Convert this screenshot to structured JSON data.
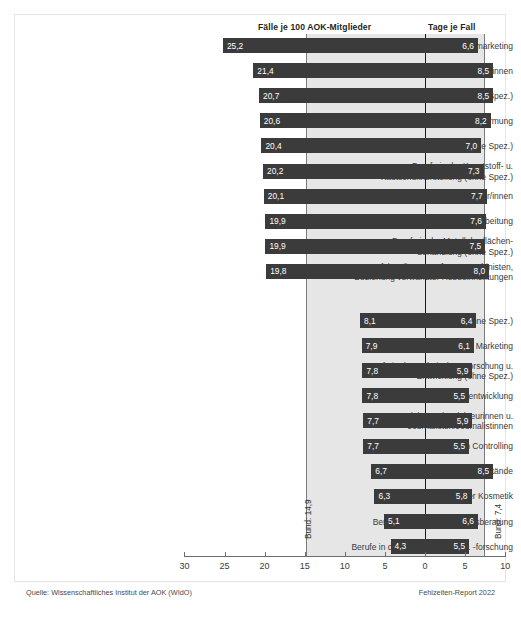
{
  "header": {
    "left_column_title": "Fälle je 100 AOK-Mitglieder",
    "right_column_title": "Tage je Fall"
  },
  "footer": {
    "source": "Quelle: Wissenschaftliches Institut der AOK (WIdO)",
    "report": "Fehlzeiten-Report 2022"
  },
  "reference_lines": {
    "bund_faelle_label": "Bund: 14,9",
    "bund_faelle_value": 14.9,
    "bund_tage_label": "Bund: 7,4",
    "bund_tage_value": 7.4
  },
  "colors": {
    "bar": "#3b3b3b",
    "band": "#e6e6e6",
    "zero_line": "#1a1a1a",
    "frame": "#e3e3e3",
    "text": "#3a3a3a"
  },
  "chart_data": {
    "type": "bar",
    "title": "",
    "subtitle": "",
    "xlabel": "",
    "ylabel": "",
    "grid": false,
    "legend": "none",
    "orientation": "horizontal",
    "layout": "diverging-dual-axis",
    "axis": {
      "tick_labels": [
        "30",
        "25",
        "20",
        "15",
        "10",
        "5",
        "0",
        "5",
        "10"
      ],
      "tick_values": [
        30,
        25,
        20,
        15,
        10,
        5,
        0,
        5,
        10
      ],
      "left_range": [
        30,
        0
      ],
      "right_range": [
        0,
        10
      ],
      "zero_at_label": "0"
    },
    "categories": [
      "Berufe im Dialogmarketing",
      "Straßen- u. Tunnelwärter/innen",
      "Berufe in der Ver- u. Entsorgung (ohne Spez.)",
      "Berufe in der Metallumformung",
      "Berufe in der Metallbearbeitung (ohne Spez.)",
      "Berufe in der Kunststoff- u.\nKautschukherstellung (ohne Spez.)",
      "Maschinen- u. Anlagenführer/innen",
      "Berufe in der schleifenden Metallbearbeitung",
      "Berufe in der Metalloberflächen-\nbehandlung (ohne Spez.)",
      "Kranführer/innen, Aufzugsmaschinisten,\nBedienung verwandter Hebeeinrichtungen",
      "Ärzte/Ärztinnen (ohne Spez.)",
      "Berufe in Werbung u. Marketing",
      "Berufe in der technischen Forschung u.\nEntwicklung (ohne Spez.)",
      "Berufe in der Softwareentwicklung",
      "Redakteure/Redakteurinnen u.\nJournalisten/Journalistinnen",
      "Berufe im Controlling",
      "Geschäftsführer/innen u. Vorstände",
      "Berufe in der Kosmetik",
      "Berufe in der Unternehmensberatung",
      "Berufe in der Hochschullehre u. -forschung"
    ],
    "series": [
      {
        "name": "Fälle je 100 AOK-Mitglieder",
        "side": "left",
        "values": [
          25.2,
          21.4,
          20.7,
          20.6,
          20.4,
          20.2,
          20.1,
          19.9,
          19.9,
          19.8,
          8.1,
          7.9,
          7.8,
          7.8,
          7.7,
          7.7,
          6.7,
          6.3,
          5.1,
          4.3
        ],
        "labels": [
          "25,2",
          "21,4",
          "20,7",
          "20,6",
          "20,4",
          "20,2",
          "20,1",
          "19,9",
          "19,9",
          "19,8",
          "8,1",
          "7,9",
          "7,8",
          "7,8",
          "7,7",
          "7,7",
          "6,7",
          "6,3",
          "5,1",
          "4,3"
        ]
      },
      {
        "name": "Tage je Fall",
        "side": "right",
        "values": [
          6.6,
          8.5,
          8.5,
          8.2,
          7.0,
          7.3,
          7.7,
          7.6,
          7.5,
          8.0,
          6.4,
          6.1,
          5.9,
          5.5,
          5.9,
          5.5,
          8.5,
          5.8,
          6.6,
          5.5
        ],
        "labels": [
          "6,6",
          "8,5",
          "8,5",
          "8,2",
          "7,0",
          "7,3",
          "7,7",
          "7,6",
          "7,5",
          "8,0",
          "6,4",
          "6,1",
          "5,9",
          "5,5",
          "5,9",
          "5,5",
          "8,5",
          "5,8",
          "6,6",
          "5,5"
        ]
      }
    ]
  }
}
